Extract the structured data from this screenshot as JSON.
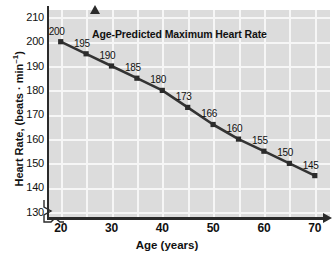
{
  "chart_data": {
    "type": "line",
    "title": "Age-Predicted Maximum Heart Rate",
    "xlabel": "Age (years)",
    "ylabel": "Heart Rate, (beats · min",
    "ylabel_sup": "–1",
    "ylabel_close": ")",
    "x": [
      20,
      25,
      30,
      35,
      40,
      45,
      50,
      55,
      60,
      65,
      70
    ],
    "values": [
      200,
      195,
      190,
      185,
      180,
      173,
      166,
      160,
      155,
      150,
      145
    ],
    "point_labels": [
      "200",
      "195",
      "190",
      "185",
      "180",
      "173",
      "166",
      "160",
      "155",
      "150",
      "145"
    ],
    "xlim": [
      17.5,
      73
    ],
    "ylim": [
      128,
      213
    ],
    "xticks": [
      "20",
      "30",
      "40",
      "50",
      "60",
      "70"
    ],
    "xtick_values": [
      20,
      30,
      40,
      50,
      60,
      70
    ],
    "yticks": [
      "210",
      "200",
      "190",
      "180",
      "170",
      "160",
      "150",
      "140",
      "130"
    ],
    "ytick_values": [
      210,
      200,
      190,
      180,
      170,
      160,
      150,
      140,
      130
    ],
    "grid": true,
    "grid_color": "#f6f6f6",
    "plot_background": "#dcdcdc",
    "series_color": "#333333",
    "marker": "square",
    "legend": "none",
    "axis_break": "origin-zigzag"
  }
}
